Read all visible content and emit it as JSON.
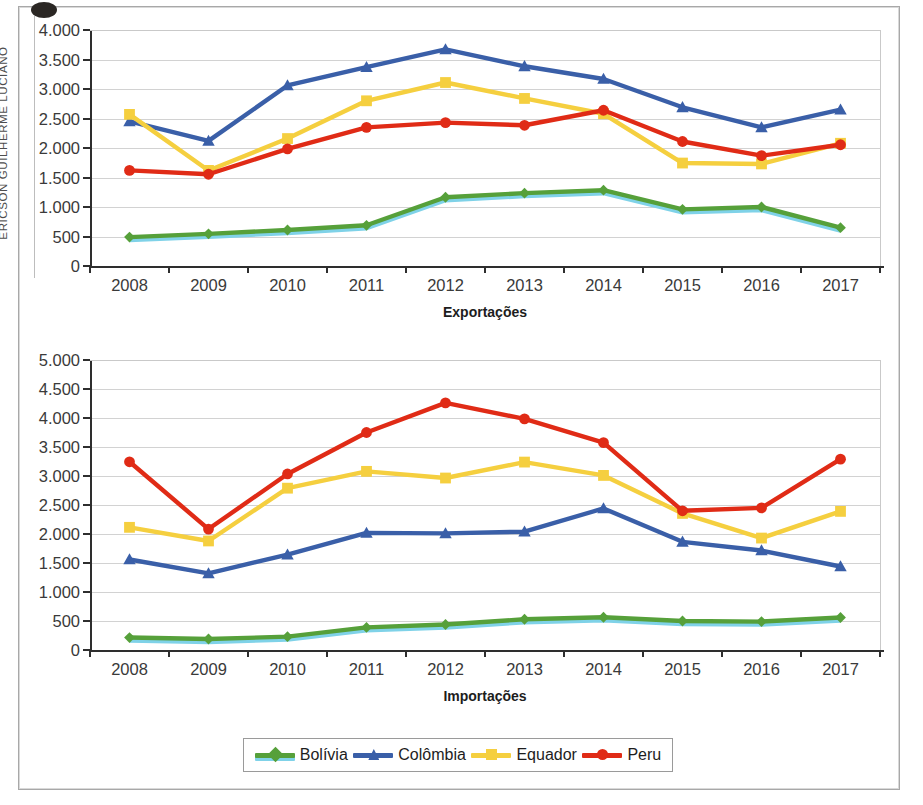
{
  "watermark": {
    "text": "ERICSON GUILHERME LUCIANO"
  },
  "legend": {
    "items": [
      {
        "label": "Bolívia",
        "color": "#56a03a",
        "marker": "diamond-marker"
      },
      {
        "label": "Colômbia",
        "color": "#3a5fa8",
        "marker": "triangle-marker"
      },
      {
        "label": "Equador",
        "color": "#f5cf3f",
        "marker": "square-marker"
      },
      {
        "label": "Peru",
        "color": "#e02b16",
        "marker": "circle-marker"
      }
    ]
  },
  "chart_data": [
    {
      "id": "exportacoes",
      "type": "line",
      "title": "",
      "xlabel": "Exportações",
      "ylabel": "",
      "categories": [
        "2008",
        "2009",
        "2010",
        "2011",
        "2012",
        "2013",
        "2014",
        "2015",
        "2016",
        "2017"
      ],
      "yticks": [
        "0",
        "500",
        "1.000",
        "1.500",
        "2.000",
        "2.500",
        "3.000",
        "3.500",
        "4.000"
      ],
      "ylim": [
        0,
        4000
      ],
      "ystep": 500,
      "grid": true,
      "legend_position": "bottom-shared",
      "series": [
        {
          "name": "Bolívia",
          "color": "#56a03a",
          "marker": "diamond",
          "values": [
            490,
            545,
            610,
            690,
            1165,
            1235,
            1285,
            960,
            1000,
            650
          ]
        },
        {
          "name": "Colômbia",
          "color": "#3a5fa8",
          "marker": "triangle",
          "values": [
            2450,
            2120,
            3060,
            3370,
            3670,
            3385,
            3170,
            2690,
            2350,
            2650
          ]
        },
        {
          "name": "Equador",
          "color": "#f5cf3f",
          "marker": "square",
          "values": [
            2570,
            1620,
            2160,
            2800,
            3110,
            2840,
            2580,
            1745,
            1730,
            2080
          ]
        },
        {
          "name": "Peru",
          "color": "#e02b16",
          "marker": "circle",
          "values": [
            1620,
            1555,
            1985,
            2350,
            2430,
            2385,
            2640,
            2110,
            1870,
            2055
          ]
        }
      ]
    },
    {
      "id": "importacoes",
      "type": "line",
      "title": "",
      "xlabel": "Importações",
      "ylabel": "",
      "categories": [
        "2008",
        "2009",
        "2010",
        "2011",
        "2012",
        "2013",
        "2014",
        "2015",
        "2016",
        "2017"
      ],
      "yticks": [
        "0",
        "500",
        "1.000",
        "1.500",
        "2.000",
        "2.500",
        "3.000",
        "3.500",
        "4.000",
        "4.500",
        "5.000"
      ],
      "ylim": [
        0,
        5000
      ],
      "ystep": 500,
      "grid": true,
      "legend_position": "bottom-shared",
      "series": [
        {
          "name": "Bolívia",
          "color": "#56a03a",
          "marker": "diamond",
          "values": [
            215,
            190,
            230,
            390,
            440,
            530,
            565,
            500,
            490,
            560
          ]
        },
        {
          "name": "Colômbia",
          "color": "#3a5fa8",
          "marker": "triangle",
          "values": [
            1560,
            1320,
            1645,
            2020,
            2010,
            2040,
            2440,
            1865,
            1715,
            1440
          ]
        },
        {
          "name": "Equador",
          "color": "#f5cf3f",
          "marker": "square",
          "values": [
            2115,
            1880,
            2790,
            3080,
            2965,
            3240,
            3010,
            2355,
            1930,
            2390
          ]
        },
        {
          "name": "Peru",
          "color": "#e02b16",
          "marker": "circle",
          "values": [
            3245,
            2085,
            3035,
            3750,
            4260,
            3985,
            3575,
            2400,
            2450,
            3290
          ]
        }
      ]
    }
  ]
}
